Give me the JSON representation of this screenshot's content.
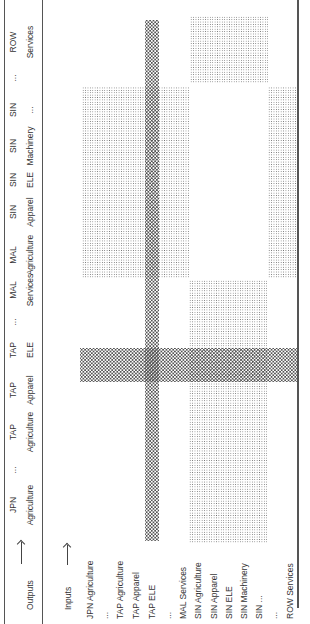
{
  "header": {
    "outputs_label": "Outputs",
    "inputs_label": "Inputs",
    "columns": [
      {
        "country": "JPN",
        "sector": "Agriculture",
        "x": 119
      },
      {
        "country": "...",
        "sector": "",
        "x": 154
      },
      {
        "country": "TAP",
        "sector": "Agriculture",
        "x": 192
      },
      {
        "country": "TAP",
        "sector": "Apparel",
        "x": 234
      },
      {
        "country": "TAP",
        "sector": "ELE",
        "x": 274
      },
      {
        "country": "...",
        "sector": "",
        "x": 302
      },
      {
        "country": "MAL",
        "sector": "Services",
        "x": 334
      },
      {
        "country": "MAL",
        "sector": "Agriculture",
        "x": 369
      },
      {
        "country": "SIN",
        "sector": "Apparel",
        "x": 412
      },
      {
        "country": "SIN",
        "sector": "ELE",
        "x": 444
      },
      {
        "country": "SIN",
        "sector": "Machinery",
        "x": 478
      },
      {
        "country": "SIN",
        "sector": "...",
        "x": 514
      },
      {
        "country": "...",
        "sector": "",
        "x": 546
      },
      {
        "country": "ROW",
        "sector": "Services",
        "x": 582
      }
    ]
  },
  "rows": [
    {
      "label": "JPN Agriculture",
      "y": 90
    },
    {
      "label": "...",
      "y": 105
    },
    {
      "label": "TAP Agriculture",
      "y": 120
    },
    {
      "label": "TAP Apparel",
      "y": 136
    },
    {
      "label": "TAP ELE",
      "y": 152
    },
    {
      "label": "...",
      "y": 168
    },
    {
      "label": "MAL Services",
      "y": 183
    },
    {
      "label": "SIN Agriculture",
      "y": 198
    },
    {
      "label": "SIN Apparel",
      "y": 214
    },
    {
      "label": "SIN ELE",
      "y": 229
    },
    {
      "label": "SIN Machinery",
      "y": 244
    },
    {
      "label": "SIN ...",
      "y": 259
    },
    {
      "label": "...",
      "y": 274
    },
    {
      "label": "ROW Services",
      "y": 290
    }
  ],
  "shaded_regions": [
    {
      "pattern": "light",
      "x": 346,
      "y": 82,
      "w": 191,
      "h": 107
    },
    {
      "pattern": "light",
      "x": 81,
      "y": 189,
      "w": 263,
      "h": 78
    },
    {
      "pattern": "light",
      "x": 541,
      "y": 190,
      "w": 67,
      "h": 78
    },
    {
      "pattern": "light",
      "x": 346,
      "y": 268,
      "w": 191,
      "h": 29
    },
    {
      "pattern": "dark",
      "x": 83,
      "y": 145,
      "w": 521,
      "h": 14
    },
    {
      "pattern": "dark",
      "x": 242,
      "y": 80,
      "w": 34,
      "h": 217
    }
  ]
}
